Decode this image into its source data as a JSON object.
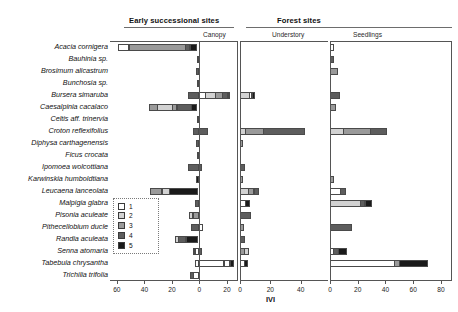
{
  "figure": {
    "axis_label": "IVI",
    "group_headers": [
      {
        "name": "early-successional-sites",
        "label": "Early successional sites"
      },
      {
        "name": "forest-sites",
        "label": "Forest sites"
      }
    ],
    "sub_headers": [
      {
        "name": "canopy",
        "label": "Canopy"
      },
      {
        "name": "understory",
        "label": "Understory"
      },
      {
        "name": "seedlings",
        "label": "Seedlings"
      }
    ],
    "legend": {
      "title": "",
      "items": [
        {
          "label": "1",
          "color": "#ffffff"
        },
        {
          "label": "2",
          "color": "#d2d2d2"
        },
        {
          "label": "3",
          "color": "#9a9a9a"
        },
        {
          "label": "4",
          "color": "#5d5d5d"
        },
        {
          "label": "5",
          "color": "#1a1a1a"
        }
      ]
    }
  },
  "chart_data": {
    "type": "bar",
    "title": "",
    "xlabel": "IVI",
    "ylabel": "",
    "grid": false,
    "orientation": "horizontal-stacked",
    "legend_position": "inside-lower-left",
    "series": [
      {
        "name": "1",
        "color": "#ffffff"
      },
      {
        "name": "2",
        "color": "#d2d2d2"
      },
      {
        "name": "3",
        "color": "#9a9a9a"
      },
      {
        "name": "4",
        "color": "#5d5d5d"
      },
      {
        "name": "5",
        "color": "#1a1a1a"
      }
    ],
    "categories": [
      "Acacia cornigera",
      "Bauhinia sp.",
      "Brosimum alicastrum",
      "Bunchosia sp.",
      "Bursera simaruba",
      "Caesalpinia cacalaco",
      "Celtis aff. trinervia",
      "Croton reflexifolius",
      "Diphysa carthagenensis",
      "Ficus crocata",
      "Ipomoea wolcottiana",
      "Karwinskia humboldtiana",
      "Leucaena lanceolata",
      "Malpigia glabra",
      "Pisonia aculeate",
      "Pithecellobium ducle",
      "Randia aculeata",
      "Senna atomaria",
      "Tabebuia chrysantha",
      "Trichilia trifolia"
    ],
    "panels": [
      {
        "name": "canopy",
        "header": "Canopy",
        "group": "split",
        "note": "diverging axis: negative side = Early successional sites, positive side = Forest sites / Canopy",
        "xlim": [
          -65,
          28
        ],
        "ticks": [
          -60,
          -40,
          -20,
          0,
          20
        ],
        "ticklabels": [
          "60",
          "40",
          "20",
          "0",
          "20"
        ],
        "rows": [
          {
            "category": "Acacia cornigera",
            "negative": [
              {
                "series": "5",
                "value": 5.5
              },
              {
                "series": "4",
                "value": 4.0
              },
              {
                "series": "3",
                "value": 41.5
              },
              {
                "series": "1",
                "value": 8.0
              }
            ],
            "positive": []
          },
          {
            "category": "Bauhinia sp.",
            "negative": [
              {
                "series": "4",
                "value": 1.5
              }
            ],
            "positive": []
          },
          {
            "category": "Brosimum alicastrum",
            "negative": [
              {
                "series": "4",
                "value": 2.5
              }
            ],
            "positive": []
          },
          {
            "category": "Bunchosia sp.",
            "negative": [
              {
                "series": "4",
                "value": 1.5
              }
            ],
            "positive": []
          },
          {
            "category": "Bursera simaruba",
            "negative": [
              {
                "series": "4",
                "value": 8.0
              }
            ],
            "positive": [
              {
                "series": "1",
                "value": 4.5
              },
              {
                "series": "2",
                "value": 8.0
              },
              {
                "series": "3",
                "value": 5.5
              },
              {
                "series": "4",
                "value": 4.5
              },
              {
                "series": "5",
                "value": 2.0
              }
            ]
          },
          {
            "category": "Caesalpinia cacalaco",
            "negative": [
              {
                "series": "5",
                "value": 4.0
              },
              {
                "series": "4",
                "value": 11.0
              },
              {
                "series": "3",
                "value": 4.0
              },
              {
                "series": "2",
                "value": 11.0
              },
              {
                "series": "3",
                "value": 6.5
              }
            ],
            "positive": []
          },
          {
            "category": "Celtis aff. trinervia",
            "negative": [
              {
                "series": "3",
                "value": 1.8
              }
            ],
            "positive": []
          },
          {
            "category": "Croton reflexifolius",
            "negative": [
              {
                "series": "4",
                "value": 5.0
              }
            ],
            "positive": [
              {
                "series": "4",
                "value": 6.5
              }
            ]
          },
          {
            "category": "Diphysa carthagenensis",
            "negative": [
              {
                "series": "4",
                "value": 2.5
              }
            ],
            "positive": []
          },
          {
            "category": "Ficus crocata",
            "negative": [
              {
                "series": "5",
                "value": 2.0
              }
            ],
            "positive": []
          },
          {
            "category": "Ipomoea wolcottiana",
            "negative": [
              {
                "series": "4",
                "value": 8.0
              }
            ],
            "positive": [
              {
                "series": "4",
                "value": 2.0
              }
            ]
          },
          {
            "category": "Karwinskia humboldtiana",
            "negative": [
              {
                "series": "5",
                "value": 2.5
              }
            ],
            "positive": []
          },
          {
            "category": "Leucaena lanceolata",
            "negative": [
              {
                "series": "5",
                "value": 21.0
              },
              {
                "series": "2",
                "value": 6.0
              },
              {
                "series": "3",
                "value": 9.0
              }
            ],
            "positive": []
          },
          {
            "category": "Malpigia glabra",
            "negative": [
              {
                "series": "4",
                "value": 3.0
              }
            ],
            "positive": []
          },
          {
            "category": "Pisonia aculeate",
            "negative": [
              {
                "series": "3",
                "value": 4.5
              },
              {
                "series": "2",
                "value": 3.0
              }
            ],
            "positive": []
          },
          {
            "category": "Pithecellobium ducle",
            "negative": [
              {
                "series": "4",
                "value": 6.0
              }
            ],
            "positive": [
              {
                "series": "1",
                "value": 2.5
              }
            ]
          },
          {
            "category": "Randia aculeata",
            "negative": [
              {
                "series": "5",
                "value": 9.0
              },
              {
                "series": "4",
                "value": 6.0
              },
              {
                "series": "2",
                "value": 3.0
              }
            ],
            "positive": []
          },
          {
            "category": "Senna atomaria",
            "negative": [
              {
                "series": "1",
                "value": 3.0
              },
              {
                "series": "5",
                "value": 1.5
              }
            ],
            "positive": [
              {
                "series": "4",
                "value": 1.5
              }
            ]
          },
          {
            "category": "Tabebuia chrysantha",
            "negative": [
              {
                "series": "1",
                "value": 3.0
              }
            ],
            "positive": [
              {
                "series": "1",
                "value": 18.0
              },
              {
                "series": "1",
                "value": 5.0
              },
              {
                "series": "5",
                "value": 3.0
              }
            ]
          },
          {
            "category": "Trichilia trifolia",
            "negative": [
              {
                "series": "1",
                "value": 4.0
              },
              {
                "series": "4",
                "value": 3.0
              }
            ],
            "positive": []
          }
        ]
      },
      {
        "name": "understory",
        "header": "Understory",
        "xlim": [
          0,
          58
        ],
        "ticks": [
          0,
          20,
          40
        ],
        "ticklabels": [
          "0",
          "20",
          "40"
        ],
        "rows": [
          {
            "category": "Acacia cornigera",
            "segments": []
          },
          {
            "category": "Bauhinia sp.",
            "segments": []
          },
          {
            "category": "Brosimum alicastrum",
            "segments": []
          },
          {
            "category": "Bunchosia sp.",
            "segments": []
          },
          {
            "category": "Bursera simaruba",
            "segments": [
              {
                "series": "2",
                "value": 6.5
              },
              {
                "series": "1",
                "value": 2.0
              },
              {
                "series": "5",
                "value": 2.5
              }
            ]
          },
          {
            "category": "Caesalpinia cacalaco",
            "segments": []
          },
          {
            "category": "Celtis aff. trinervia",
            "segments": []
          },
          {
            "category": "Croton reflexifolius",
            "segments": [
              {
                "series": "2",
                "value": 4.0
              },
              {
                "series": "3",
                "value": 12.0
              },
              {
                "series": "4",
                "value": 28.0
              }
            ]
          },
          {
            "category": "Diphysa carthagenensis",
            "segments": [
              {
                "series": "3",
                "value": 1.8
              }
            ]
          },
          {
            "category": "Ficus crocata",
            "segments": []
          },
          {
            "category": "Ipomoea wolcottiana",
            "segments": [
              {
                "series": "4",
                "value": 3.0
              }
            ]
          },
          {
            "category": "Karwinskia humboldtiana",
            "segments": [
              {
                "series": "3",
                "value": 1.8
              }
            ]
          },
          {
            "category": "Leucaena lanceolata",
            "segments": [
              {
                "series": "2",
                "value": 6.0
              },
              {
                "series": "3",
                "value": 4.0
              },
              {
                "series": "4",
                "value": 3.5
              }
            ]
          },
          {
            "category": "Malpigia glabra",
            "segments": [
              {
                "series": "1",
                "value": 4.0
              },
              {
                "series": "5",
                "value": 3.0
              }
            ]
          },
          {
            "category": "Pisonia aculeate",
            "segments": [
              {
                "series": "4",
                "value": 7.0
              }
            ]
          },
          {
            "category": "Pithecellobium ducle",
            "segments": [
              {
                "series": "3",
                "value": 2.5
              }
            ]
          },
          {
            "category": "Randia aculeata",
            "segments": [
              {
                "series": "4",
                "value": 3.5
              }
            ]
          },
          {
            "category": "Senna atomaria",
            "segments": [
              {
                "series": "3",
                "value": 3.0
              },
              {
                "series": "2",
                "value": 3.5
              }
            ]
          },
          {
            "category": "Tabebuia chrysantha",
            "segments": [
              {
                "series": "1",
                "value": 3.0
              },
              {
                "series": "5",
                "value": 2.5
              }
            ]
          },
          {
            "category": "Trichilia trifolia",
            "segments": []
          }
        ]
      },
      {
        "name": "seedlings",
        "header": "Seedlings",
        "xlim": [
          0,
          88
        ],
        "ticks": [
          0,
          20,
          40,
          60,
          80
        ],
        "ticklabels": [
          "0",
          "20",
          "40",
          "60",
          "80"
        ],
        "rows": [
          {
            "category": "Acacia cornigera",
            "segments": [
              {
                "series": "1",
                "value": 3.0
              }
            ]
          },
          {
            "category": "Bauhinia sp.",
            "segments": [
              {
                "series": "4",
                "value": 3.0
              }
            ]
          },
          {
            "category": "Brosimum alicastrum",
            "segments": [
              {
                "series": "3",
                "value": 6.0
              }
            ]
          },
          {
            "category": "Bunchosia sp.",
            "segments": []
          },
          {
            "category": "Bursera simaruba",
            "segments": [
              {
                "series": "4",
                "value": 7.0
              }
            ]
          },
          {
            "category": "Caesalpinia cacalaco",
            "segments": [
              {
                "series": "3",
                "value": 4.0
              }
            ]
          },
          {
            "category": "Celtis aff. trinervia",
            "segments": []
          },
          {
            "category": "Croton reflexifolius",
            "segments": [
              {
                "series": "2",
                "value": 10.0
              },
              {
                "series": "3",
                "value": 20.0
              },
              {
                "series": "4",
                "value": 12.0
              }
            ]
          },
          {
            "category": "Diphysa carthagenensis",
            "segments": []
          },
          {
            "category": "Ficus crocata",
            "segments": []
          },
          {
            "category": "Ipomoea wolcottiana",
            "segments": []
          },
          {
            "category": "Karwinskia humboldtiana",
            "segments": [
              {
                "series": "3",
                "value": 3.0
              }
            ]
          },
          {
            "category": "Leucaena lanceolata",
            "segments": [
              {
                "series": "1",
                "value": 8.0
              },
              {
                "series": "4",
                "value": 4.0
              }
            ]
          },
          {
            "category": "Malpigia glabra",
            "segments": [
              {
                "series": "2",
                "value": 22.0
              },
              {
                "series": "4",
                "value": 4.0
              },
              {
                "series": "5",
                "value": 5.0
              }
            ]
          },
          {
            "category": "Pisonia aculeate",
            "segments": []
          },
          {
            "category": "Pithecellobium ducle",
            "segments": [
              {
                "series": "4",
                "value": 16.0
              }
            ]
          },
          {
            "category": "Randia aculeata",
            "segments": []
          },
          {
            "category": "Senna atomaria",
            "segments": [
              {
                "series": "1",
                "value": 3.0
              },
              {
                "series": "4",
                "value": 4.0
              },
              {
                "series": "5",
                "value": 6.0
              }
            ]
          },
          {
            "category": "Tabebuia chrysantha",
            "segments": [
              {
                "series": "1",
                "value": 47.0
              },
              {
                "series": "3",
                "value": 4.0
              },
              {
                "series": "5",
                "value": 21.0
              }
            ]
          },
          {
            "category": "Trichilia trifolia",
            "segments": []
          }
        ]
      }
    ]
  }
}
